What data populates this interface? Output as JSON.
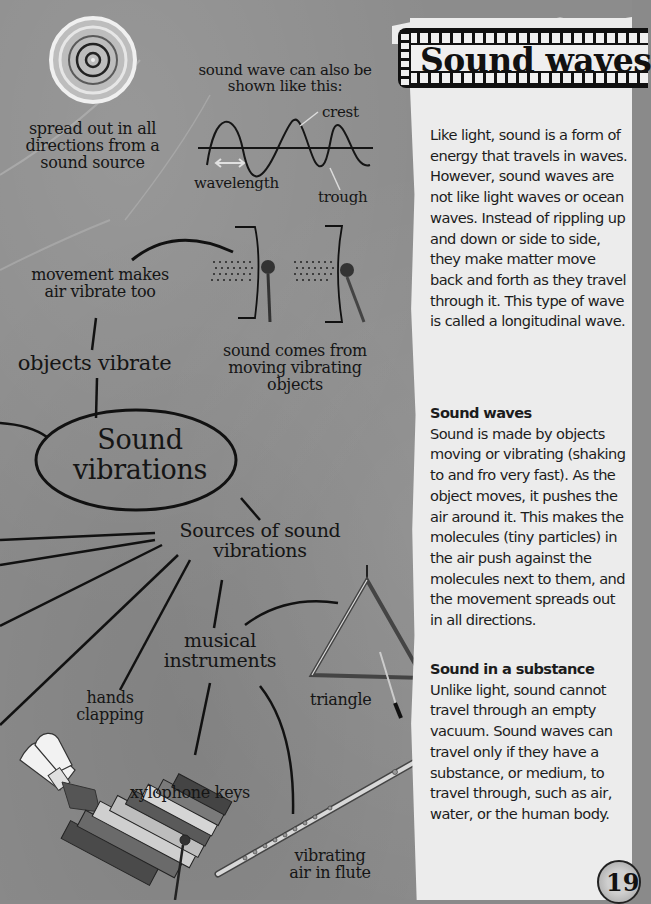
{
  "page": {
    "title": "Sound waves",
    "page_number": "19"
  },
  "diagram": {
    "ripple_caption": "spread out in all directions from a sound source",
    "ripple_lines": [
      "spread out in all",
      "directions from a",
      "sound source"
    ],
    "wave_caption_lines": [
      "sound wave can also be",
      "shown like this:"
    ],
    "wave_labels": {
      "crest": "crest",
      "trough": "trough",
      "wavelength": "wavelength"
    },
    "movement_lines": [
      "movement makes",
      "air vibrate too"
    ],
    "objects_vibrate": "objects vibrate",
    "comes_from_lines": [
      "sound comes from",
      "moving vibrating",
      "objects"
    ],
    "center_lines": [
      "Sound",
      "vibrations"
    ],
    "sources_lines": [
      "Sources of sound",
      "vibrations"
    ],
    "musical_lines": [
      "musical",
      "instruments"
    ],
    "hands_lines": [
      "hands",
      "clapping"
    ],
    "triangle": "triangle",
    "xylophone": "xylophone keys",
    "flute_lines": [
      "vibrating",
      "air in flute"
    ]
  },
  "article": {
    "intro": "Like light, sound is a form of energy that travels in waves. However, sound waves are not like light waves or ocean waves. Instead of rippling up and down or side to side, they make matter move back and forth as they travel through it. This type of wave is called a longitudinal wave.",
    "sections": [
      {
        "heading": "Sound waves",
        "text": "Sound is made by objects moving or vibrating (shaking to and fro very fast). As the object moves, it pushes the air around it. This makes the molecules (tiny particles) in the air push against the molecules next to them, and the movement spreads out in all directions."
      },
      {
        "heading": "Sound in a substance",
        "text": "Unlike light, sound cannot travel through an empty vacuum. Sound waves can travel only if they have a substance, or medium, to travel through, such as air, water, or the human body."
      }
    ]
  },
  "colors": {
    "background": "#8c8c8c",
    "panel": "#ececec",
    "ink": "#141414"
  }
}
